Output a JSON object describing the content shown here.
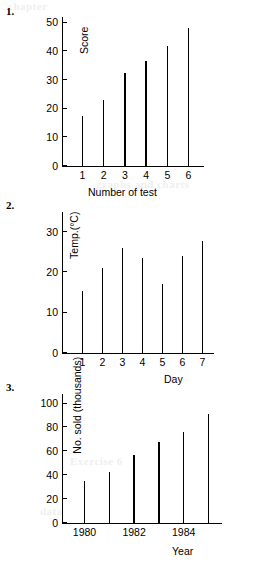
{
  "page": {
    "background": "#ffffff",
    "ink": "#000000"
  },
  "exercises": [
    {
      "number": "1."
    },
    {
      "number": "2."
    },
    {
      "number": "3."
    }
  ],
  "bleed_through": [
    {
      "text": "chapter",
      "x": 8,
      "y": 0
    },
    {
      "text": "graphs and charts",
      "x": 96,
      "y": 178
    },
    {
      "text": "Exercise 6",
      "x": 70,
      "y": 455
    },
    {
      "text": "data",
      "x": 40,
      "y": 505
    }
  ],
  "chart_data": [
    {
      "type": "bar",
      "title": "",
      "xlabel": "Number of test",
      "ylabel": "Score",
      "categories": [
        "1",
        "2",
        "3",
        "4",
        "5",
        "6"
      ],
      "values": [
        17.5,
        23,
        32.5,
        36.5,
        42,
        48
      ],
      "ylim": [
        0,
        52
      ],
      "yticks": [
        0,
        10,
        20,
        30,
        40,
        50
      ],
      "ytick_labels": [
        "0",
        "10",
        "20",
        "30",
        "40",
        "50"
      ],
      "grid": false,
      "legend": "none"
    },
    {
      "type": "bar",
      "title": "",
      "xlabel": "Day",
      "ylabel": "Temp.(°C)",
      "categories": [
        "1",
        "2",
        "3",
        "4",
        "5",
        "6",
        "7"
      ],
      "values": [
        15.3,
        21,
        26,
        23.5,
        17.2,
        24,
        27.8
      ],
      "ylim": [
        0,
        35
      ],
      "yticks": [
        0,
        10,
        20,
        30
      ],
      "ytick_labels": [
        "0",
        "10",
        "20",
        "30"
      ],
      "grid": false,
      "legend": "none"
    },
    {
      "type": "bar",
      "title": "",
      "xlabel": "Year",
      "ylabel": "No. sold (thousands)",
      "categories": [
        "1980",
        "1981",
        "1982",
        "1983",
        "1984",
        "1985"
      ],
      "tick_labels_shown": [
        "1980",
        "",
        "1982",
        "",
        "1984",
        ""
      ],
      "values": [
        35,
        43,
        57,
        68,
        76,
        91
      ],
      "ylim": [
        0,
        108
      ],
      "yticks": [
        0,
        20,
        40,
        60,
        80,
        100
      ],
      "ytick_labels": [
        "0",
        "20",
        "40",
        "60",
        "80",
        "100"
      ],
      "grid": false,
      "legend": "none"
    }
  ]
}
